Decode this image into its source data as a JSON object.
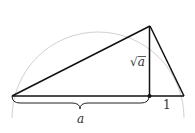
{
  "diagram": {
    "labels": {
      "altitude": "√a",
      "altitude_radicand": "a",
      "left_segment": "a",
      "right_segment": "1"
    },
    "segments": {
      "a": "a",
      "unit": 1
    },
    "colors": {
      "stroke": "#111111",
      "circle": "#bbbbbb",
      "text": "#333333"
    }
  }
}
